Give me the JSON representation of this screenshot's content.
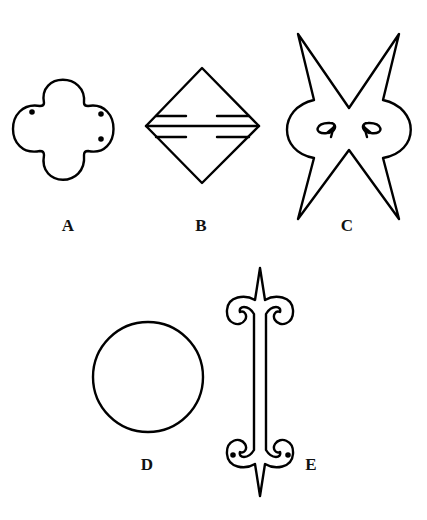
{
  "figure": {
    "stroke_color": "#000000",
    "background": "#ffffff",
    "shapes": [
      {
        "id": "A",
        "label": "A",
        "description": "quatrefoil with three dots"
      },
      {
        "id": "B",
        "label": "B",
        "description": "diamond with three horizontal lines, outer two broken in middle"
      },
      {
        "id": "C",
        "label": "C",
        "description": "four-pointed X star with side lobes and inward curled loops"
      },
      {
        "id": "D",
        "label": "D",
        "description": "circle"
      },
      {
        "id": "E",
        "label": "E",
        "description": "vertical bar with pointed ends and scroll curls, two dots at bottom"
      }
    ]
  }
}
